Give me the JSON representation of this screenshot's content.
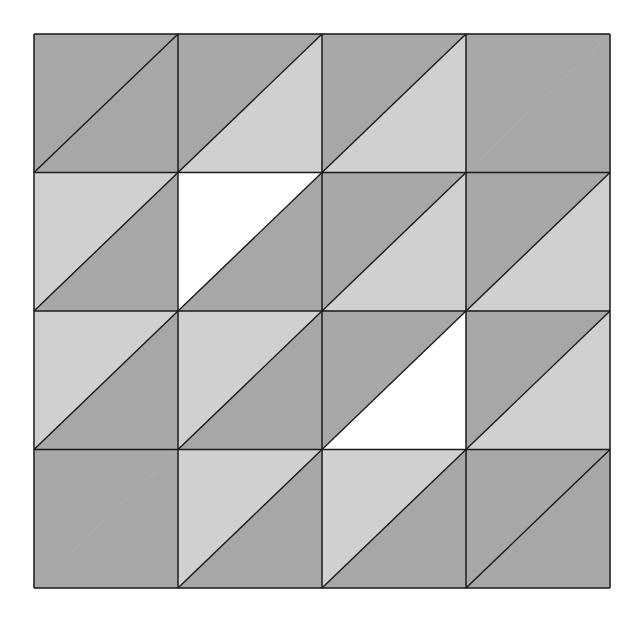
{
  "diagram": {
    "rows": 4,
    "cols": 4,
    "colors": {
      "dark": "#a7a7a7",
      "light": "#d0d0d0",
      "white": "#ffffff",
      "line": "#1a1a1a",
      "background": "#ffffff"
    },
    "cells": [
      [
        {
          "upper_left": "dark",
          "lower_right": "dark",
          "diagonal": true
        },
        {
          "upper_left": "dark",
          "lower_right": "light",
          "diagonal": true
        },
        {
          "upper_left": "dark",
          "lower_right": "light",
          "diagonal": true
        },
        {
          "upper_left": "dark",
          "lower_right": "dark",
          "diagonal": false
        }
      ],
      [
        {
          "upper_left": "light",
          "lower_right": "dark",
          "diagonal": true
        },
        {
          "upper_left": "white",
          "lower_right": "dark",
          "diagonal": true
        },
        {
          "upper_left": "dark",
          "lower_right": "light",
          "diagonal": true
        },
        {
          "upper_left": "dark",
          "lower_right": "light",
          "diagonal": true
        }
      ],
      [
        {
          "upper_left": "light",
          "lower_right": "dark",
          "diagonal": true
        },
        {
          "upper_left": "light",
          "lower_right": "dark",
          "diagonal": true
        },
        {
          "upper_left": "dark",
          "lower_right": "white",
          "diagonal": true
        },
        {
          "upper_left": "dark",
          "lower_right": "light",
          "diagonal": true
        }
      ],
      [
        {
          "upper_left": "dark",
          "lower_right": "dark",
          "diagonal": false
        },
        {
          "upper_left": "light",
          "lower_right": "dark",
          "diagonal": true
        },
        {
          "upper_left": "light",
          "lower_right": "dark",
          "diagonal": true
        },
        {
          "upper_left": "dark",
          "lower_right": "dark",
          "diagonal": true
        }
      ]
    ]
  }
}
